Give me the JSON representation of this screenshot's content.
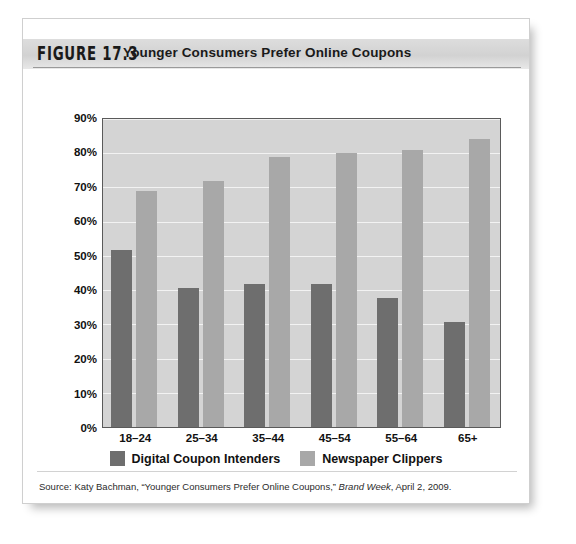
{
  "figure": {
    "label": "FIGURE 17.3",
    "title": "Younger Consumers Prefer Online Coupons",
    "source_prefix": "Source: Katy Bachman, “Younger Consumers Prefer Online Coupons,” ",
    "source_italic": "Brand Week",
    "source_suffix": ", April 2, 2009."
  },
  "colors": {
    "series_dark": "#6e6e6e",
    "series_light": "#a8a8a8",
    "plot_background": "#d4d4d4",
    "gridline": "#f2f2f2",
    "plot_border": "#5a5a5a",
    "header_band": "#d2d2d2",
    "page_background": "#ffffff"
  },
  "chart_data": {
    "type": "bar",
    "title": "Younger Consumers Prefer Online Coupons",
    "xlabel": "",
    "ylabel": "",
    "ylim": [
      0,
      90
    ],
    "ytick_step": 10,
    "grid": true,
    "legend_position": "bottom",
    "categories": [
      "18–24",
      "25–34",
      "35–44",
      "45–54",
      "55–64",
      "65+"
    ],
    "ytick_labels": [
      "0%",
      "10%",
      "20%",
      "30%",
      "40%",
      "50%",
      "60%",
      "70%",
      "80%",
      "90%"
    ],
    "series": [
      {
        "name": "Digital Coupon Intenders",
        "color": "#6e6e6e",
        "values": [
          51.5,
          40.5,
          41.5,
          41.5,
          37.5,
          30.5
        ]
      },
      {
        "name": "Newspaper Clippers",
        "color": "#a8a8a8",
        "values": [
          68.5,
          71.5,
          78.5,
          79.5,
          80.5,
          83.5
        ]
      }
    ]
  }
}
